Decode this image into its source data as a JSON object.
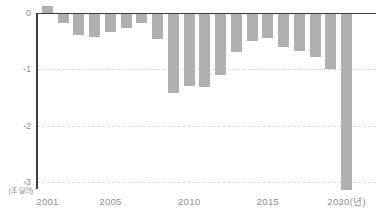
{
  "chart_data": {
    "type": "bar",
    "title": "",
    "unit_label": "(조 달러)",
    "categories": [
      2001,
      2002,
      2003,
      2004,
      2005,
      2006,
      2007,
      2008,
      2009,
      2010,
      2011,
      2012,
      2013,
      2014,
      2015,
      2016,
      2017,
      2018,
      2019,
      2020
    ],
    "values": [
      0.13,
      -0.16,
      -0.38,
      -0.41,
      -0.32,
      -0.25,
      -0.16,
      -0.46,
      -1.41,
      -1.29,
      -1.3,
      -1.09,
      -0.68,
      -0.48,
      -0.44,
      -0.59,
      -0.67,
      -0.78,
      -0.98,
      -3.13
    ],
    "x_ticks": [
      {
        "year": 2001,
        "label": "2001"
      },
      {
        "year": 2005,
        "label": "2005"
      },
      {
        "year": 2010,
        "label": "2010"
      },
      {
        "year": 2015,
        "label": "2015"
      },
      {
        "year": 2020,
        "label": "2020(년)"
      }
    ],
    "y_ticks": [
      {
        "value": 0,
        "label": "0"
      },
      {
        "value": -1,
        "label": "-1"
      },
      {
        "value": -2,
        "label": "-2"
      },
      {
        "value": -3,
        "label": "-3"
      }
    ],
    "ylim": [
      -3.2,
      0.3
    ],
    "xlabel": "",
    "ylabel": "",
    "grid": "horizontal-dashed",
    "legend": "none",
    "colors": {
      "bar": "#b0b0b0",
      "grid": "#d8d8d8",
      "axis": "#3d3d3d",
      "label": "#8e8e8e",
      "background": "#ffffff"
    }
  }
}
